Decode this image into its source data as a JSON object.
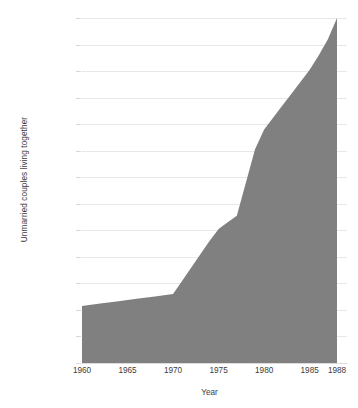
{
  "chart_data": {
    "type": "area",
    "title": "",
    "subtitle": "",
    "xlabel": "Year",
    "ylabel": "Unmarried couples living together",
    "xlim": [
      1960,
      1988
    ],
    "ylim": [
      0,
      2600000
    ],
    "grid": true,
    "legend": null,
    "legend_position": "none",
    "series_color": "#808080",
    "gridline_color": "#e8e8e8",
    "background_color": "#ffffff",
    "text_color": "#3c3c3c",
    "x_tick_labels": [
      "1960",
      "1965",
      "1970",
      "1975",
      "1980",
      "1985",
      "1988"
    ],
    "x_tick_values": [
      1960,
      1965,
      1970,
      1975,
      1980,
      1985,
      1988
    ],
    "y_tick_labels": [
      "0",
      "200,000",
      "400,000",
      "600,000",
      "800,000",
      "1,000,000",
      "1,200,000",
      "1,400,000",
      "1,600,000",
      "1,800,000",
      "2,000,000",
      "2,200,000",
      "2,400,000",
      "2,600,000"
    ],
    "y_tick_values": [
      0,
      200000,
      400000,
      600000,
      800000,
      1000000,
      1200000,
      1400000,
      1600000,
      1800000,
      2000000,
      2200000,
      2400000,
      2600000
    ],
    "x": [
      1960,
      1962,
      1964,
      1966,
      1968,
      1970,
      1971,
      1972,
      1973,
      1974,
      1975,
      1976,
      1977,
      1978,
      1979,
      1980,
      1981,
      1982,
      1983,
      1984,
      1985,
      1986,
      1987,
      1988
    ],
    "values": [
      430000,
      448000,
      466000,
      484000,
      502000,
      520000,
      620000,
      720000,
      820000,
      920000,
      1010000,
      1060000,
      1110000,
      1360000,
      1610000,
      1760000,
      1850000,
      1940000,
      2030000,
      2120000,
      2210000,
      2320000,
      2440000,
      2600000
    ],
    "series": [
      {
        "name": "Unmarried couples living together",
        "color": "#808080",
        "values": [
          430000,
          448000,
          466000,
          484000,
          502000,
          520000,
          620000,
          720000,
          820000,
          920000,
          1010000,
          1060000,
          1110000,
          1360000,
          1610000,
          1760000,
          1850000,
          1940000,
          2030000,
          2120000,
          2210000,
          2320000,
          2440000,
          2600000
        ]
      }
    ]
  }
}
